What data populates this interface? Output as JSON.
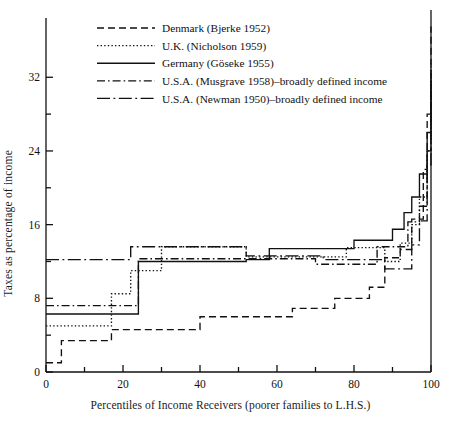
{
  "chart_data": {
    "type": "line",
    "title": "",
    "xlabel": "Percentiles of Income Receivers (poorer families to L.H.S.)",
    "ylabel": "Taxes as percentage of income",
    "xlim": [
      0,
      100
    ],
    "ylim": [
      0,
      38
    ],
    "grid": false,
    "step": "post",
    "legend_position": "top-left-inside",
    "xticks_major": [
      0,
      20,
      40,
      60,
      80,
      100
    ],
    "xticks_minor": [
      10,
      30,
      50,
      70,
      90
    ],
    "xtick_labels": [
      "0",
      "20",
      "40",
      "60",
      "80",
      "100"
    ],
    "yticks_major": [
      0,
      8,
      16,
      24,
      32
    ],
    "yticks_minor": [
      4,
      12,
      20,
      28
    ],
    "ytick_labels": [
      "0",
      "8",
      "16",
      "24",
      "32"
    ],
    "series": [
      {
        "name": "Denmark (Bjerke 1952)",
        "style": "dashed",
        "x": [
          0,
          4,
          10,
          17,
          30,
          40,
          50,
          64,
          75,
          84,
          88,
          92,
          95,
          97,
          98,
          99,
          100
        ],
        "y": [
          1.0,
          3.4,
          3.4,
          4.6,
          4.6,
          6.0,
          6.0,
          6.9,
          8.0,
          9.2,
          12.4,
          13.3,
          16.6,
          16.6,
          22.0,
          28.0,
          37.5
        ]
      },
      {
        "name": "U.K. (Nicholson 1959)",
        "style": "dotted",
        "x": [
          0,
          12,
          17,
          22,
          30,
          40,
          52,
          62,
          78,
          84,
          88,
          92,
          95,
          97,
          99,
          100
        ],
        "y": [
          5.0,
          5.0,
          8.5,
          11.0,
          13.6,
          13.6,
          12.5,
          12.5,
          13.5,
          13.5,
          12.0,
          14.0,
          16.0,
          19.0,
          24.0,
          33.5
        ]
      },
      {
        "name": "Germany (Göseke 1955)",
        "style": "solid",
        "x": [
          0,
          18,
          24,
          40,
          52,
          58,
          70,
          80,
          86,
          90,
          93,
          95,
          97,
          99,
          100
        ],
        "y": [
          6.3,
          6.3,
          12.0,
          12.0,
          12.2,
          13.4,
          13.4,
          14.3,
          14.3,
          15.5,
          17.3,
          19.0,
          21.5,
          26.0,
          32.5
        ]
      },
      {
        "name": "U.S.A. (Musgrave 1958)–broadly defined income",
        "style": "dashdot",
        "x": [
          0,
          20,
          24,
          40,
          52,
          60,
          70,
          80,
          86,
          90,
          94,
          97,
          99,
          100
        ],
        "y": [
          7.2,
          7.2,
          12.3,
          12.3,
          12.3,
          12.3,
          11.7,
          11.7,
          13.6,
          13.6,
          16.3,
          18.0,
          24.0,
          31.5
        ]
      },
      {
        "name": "U.S.A. (Newman 1950)–broadly defined income",
        "style": "longdashdot",
        "x": [
          0,
          17,
          22,
          40,
          52,
          64,
          72,
          82,
          88,
          92,
          95,
          97,
          99,
          100
        ],
        "y": [
          12.2,
          12.2,
          13.6,
          13.6,
          12.6,
          12.6,
          12.2,
          12.2,
          11.2,
          11.2,
          13.8,
          16.4,
          22.5,
          30.5
        ]
      }
    ],
    "legend_entries": [
      "Denmark (Bjerke 1952)",
      "U.K. (Nicholson 1959)",
      "Germany (Göseke 1955)",
      "U.S.A. (Musgrave 1958)–broadly defined income",
      "U.S.A. (Newman 1950)–broadly defined income"
    ],
    "axis_color": "#111111"
  }
}
